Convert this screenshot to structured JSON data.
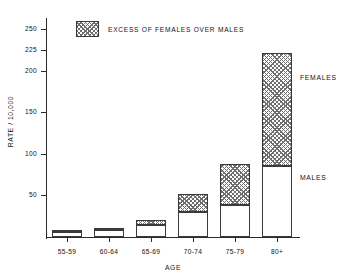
{
  "chart_data": {
    "type": "bar",
    "stacked": true,
    "title": "",
    "xlabel": "AGE",
    "ylabel": "RATE / 10,000",
    "categories": [
      "55-59",
      "60-64",
      "65-69",
      "70-74",
      "75-79",
      "80+"
    ],
    "series": [
      {
        "name": "MALES",
        "values": [
          6,
          8,
          14,
          30,
          38,
          85
        ]
      },
      {
        "name": "EXCESS OF FEMALES OVER MALES",
        "values": [
          3,
          3,
          7,
          22,
          50,
          137
        ]
      }
    ],
    "totals": [
      9,
      11,
      21,
      52,
      88,
      222
    ],
    "ylim": [
      0,
      260
    ],
    "yticks": [
      50,
      100,
      150,
      200,
      225,
      250
    ],
    "ytick_labels": [
      "50",
      "100",
      "150",
      "200",
      "225",
      "250"
    ],
    "grid": false,
    "legend": {
      "position": "top-left-inside",
      "entries": [
        {
          "label": "EXCESS OF FEMALES OVER MALES",
          "pattern": "cross-hatch"
        }
      ]
    },
    "annotations": [
      {
        "text": "FEMALES",
        "target": "80+ upper segment"
      },
      {
        "text": "MALES",
        "target": "80+ lower segment"
      }
    ],
    "colors": {
      "axis": "#2b2b2b",
      "bar_outline": "#3a3a3a",
      "male_fill": "#ffffff",
      "female_hatch": "#6e6e6e"
    }
  }
}
